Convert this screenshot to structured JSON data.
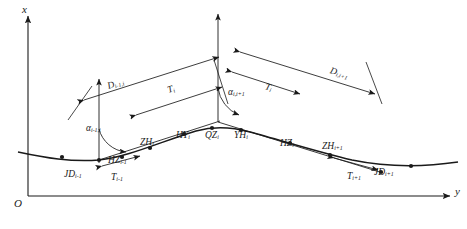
{
  "figure": {
    "type": "surveying-alignment-geometry-diagram",
    "background_color": "#ffffff",
    "stroke_color": "#1a1a1a"
  },
  "axes": {
    "x_label": "x",
    "y_label": "y",
    "origin_label": "O",
    "x_axis": {
      "x": 28,
      "y_top": 14,
      "y_bottom": 196
    },
    "y_axis": {
      "y": 196,
      "x_left": 28,
      "x_right": 452
    }
  },
  "vertical_reference_axes": [
    {
      "name": "axis-at-jd-prev",
      "x": 99,
      "y_top": 77,
      "y_bottom": 163
    },
    {
      "name": "axis-at-jd-i",
      "x": 218,
      "y_top": 12,
      "y_bottom": 122
    }
  ],
  "alignment_curve": {
    "description": "road horizontal alignment polyline with transition curves",
    "path": "M 18 152 C 46 158 70 162 99 160 C 128 157 160 142 196 131 C 214 126 232 127 250 132 C 280 140 318 152 352 160 C 386 167 424 167 458 162"
  },
  "tangent_lines": [
    {
      "name": "tangent-prev-to-jd-i",
      "x1": 99,
      "y1": 160,
      "x2": 218,
      "y2": 122
    },
    {
      "name": "tangent-jd-i-to-next",
      "x1": 218,
      "y1": 122,
      "x2": 381,
      "y2": 172
    }
  ],
  "curve_points": [
    {
      "id": "JD_prev",
      "label": "JD",
      "sub": "i-1",
      "cx": 99,
      "cy": 160,
      "lx": 64,
      "ly": 170
    },
    {
      "id": "HZ_prev",
      "label": "HZ",
      "sub": "i-1",
      "cx": 122,
      "cy": 157,
      "lx": 108,
      "ly": 156
    },
    {
      "id": "ZH_i",
      "label": "ZH",
      "sub": "i",
      "cx": 150,
      "cy": 148,
      "lx": 140,
      "ly": 138
    },
    {
      "id": "HY_i",
      "label": "HY",
      "sub": "i",
      "cx": 184,
      "cy": 134,
      "lx": 176,
      "ly": 131
    },
    {
      "id": "QZ_i",
      "label": "QZ",
      "sub": "i",
      "cx": 212,
      "cy": 128,
      "lx": 205,
      "ly": 131
    },
    {
      "id": "YH_i",
      "label": "YH",
      "sub": "i",
      "cx": 241,
      "cy": 130,
      "lx": 234,
      "ly": 131
    },
    {
      "id": "HZ_i",
      "label": "HZ",
      "sub": "i",
      "cx": 290,
      "cy": 143,
      "lx": 280,
      "ly": 139
    },
    {
      "id": "ZH_next",
      "label": "ZH",
      "sub": "i+1",
      "cx": 330,
      "cy": 155,
      "lx": 322,
      "ly": 142
    },
    {
      "id": "JD_next",
      "label": "JD",
      "sub": "i+1",
      "cx": 381,
      "cy": 172,
      "lx": 374,
      "ly": 168
    },
    {
      "id": "pt_left",
      "label": "",
      "sub": "",
      "cx": 62,
      "cy": 157,
      "lx": 0,
      "ly": 0
    },
    {
      "id": "pt_right",
      "label": "",
      "sub": "",
      "cx": 411,
      "cy": 166,
      "lx": 0,
      "ly": 0
    }
  ],
  "dimensions": [
    {
      "id": "D_prev_i",
      "label": "D",
      "sub": "i-1,i",
      "lx": 108,
      "ly": 82,
      "rot": -18
    },
    {
      "id": "T_i_left",
      "label": "T",
      "sub": "i",
      "lx": 168,
      "ly": 86,
      "rot": -18
    },
    {
      "id": "T_i_right",
      "label": "T",
      "sub": "i",
      "lx": 265,
      "ly": 82,
      "rot": 17
    },
    {
      "id": "D_i_next",
      "label": "D",
      "sub": "i,i+1",
      "lx": 330,
      "ly": 66,
      "rot": 17
    },
    {
      "id": "T_prev",
      "label": "T",
      "sub": "i-1",
      "lx": 111,
      "ly": 173,
      "rot": 0
    },
    {
      "id": "T_next",
      "label": "T",
      "sub": "i+1",
      "lx": 347,
      "ly": 172,
      "rot": 0
    }
  ],
  "angles": [
    {
      "id": "alpha_prev_i",
      "label": "α",
      "sub": "i-1,i",
      "lx": 86,
      "ly": 124
    },
    {
      "id": "alpha_i_next",
      "label": "α",
      "sub": "i,i+1",
      "lx": 228,
      "ly": 88
    }
  ]
}
